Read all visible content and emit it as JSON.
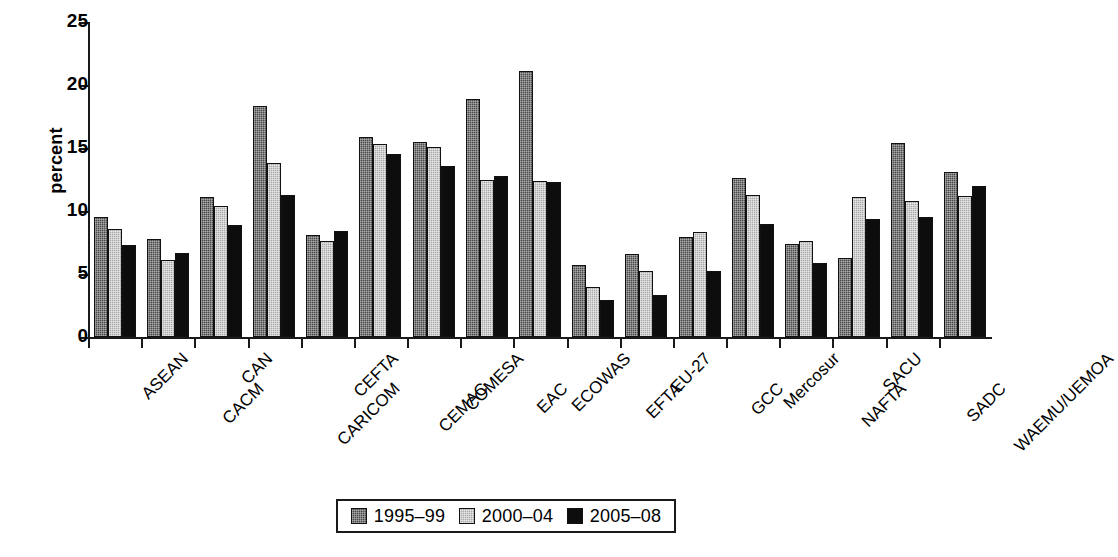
{
  "chart_data": {
    "type": "bar",
    "title": "",
    "xlabel": "",
    "ylabel": "percent",
    "ylim": [
      0,
      25
    ],
    "yticks": [
      0,
      5,
      10,
      15,
      20,
      25
    ],
    "grid": false,
    "legend_position": "bottom-center",
    "categories": [
      "ASEAN",
      "CACM",
      "CAN",
      "CARICOM",
      "CEFTA",
      "CEMAC",
      "COMESA",
      "EAC",
      "ECOWAS",
      "EFTA",
      "EU-27",
      "GCC",
      "Mercosur",
      "NAFTA",
      "SACU",
      "SADC",
      "WAEMU/UEMOA"
    ],
    "series": [
      {
        "name": "1995–99",
        "color": "#4a4a4a",
        "values": [
          9.5,
          7.8,
          11.1,
          18.3,
          8.1,
          15.9,
          15.5,
          18.9,
          21.1,
          5.7,
          6.6,
          7.9,
          12.6,
          7.4,
          6.3,
          15.4,
          13.1
        ]
      },
      {
        "name": "2000–04",
        "color": "#a9a9a9",
        "values": [
          8.6,
          6.1,
          10.4,
          13.8,
          7.6,
          15.3,
          15.1,
          12.5,
          12.4,
          4.0,
          5.2,
          8.3,
          11.3,
          7.6,
          11.1,
          10.8,
          11.2
        ]
      },
      {
        "name": "2005–08",
        "color": "#0d0d0d",
        "values": [
          7.3,
          6.7,
          8.9,
          11.3,
          8.4,
          14.5,
          13.6,
          12.8,
          12.3,
          2.9,
          3.3,
          5.2,
          9.0,
          5.9,
          9.4,
          9.5,
          12.0
        ]
      }
    ]
  },
  "axis": {
    "y_label": "percent",
    "y_tick_labels": [
      "25",
      "20",
      "15",
      "10",
      "5",
      "0"
    ]
  },
  "legend": {
    "items": [
      {
        "label": "1995–99",
        "swatch": "dark-gray-dither"
      },
      {
        "label": "2000–04",
        "swatch": "light-gray-dither"
      },
      {
        "label": "2005–08",
        "swatch": "black-solid"
      }
    ]
  }
}
